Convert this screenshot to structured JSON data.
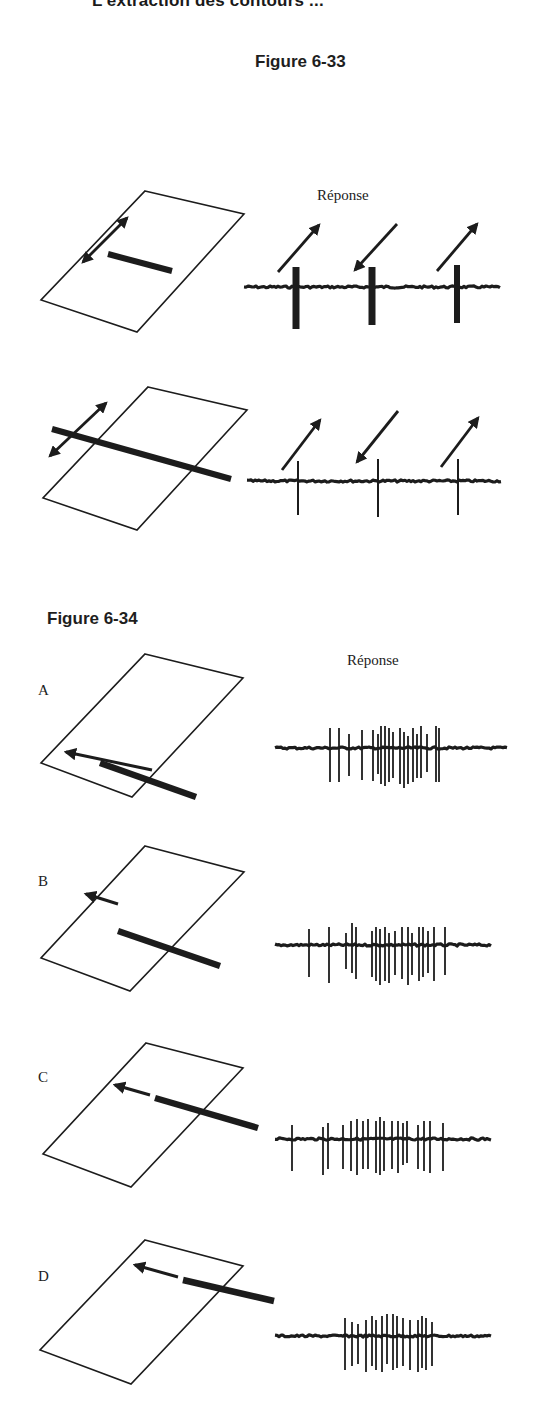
{
  "page": {
    "running_head": "L'extraction des contours ...",
    "figures": [
      {
        "id": "fig-6-33",
        "title": "Figure 6-33",
        "response_label": "Réponse",
        "rows": [
          {
            "stimulus": "short bar inside receptive field, moved back and forth (double arrow) parallel to long axis of field",
            "response_arrows": [
              "up-right",
              "down-left",
              "up-right"
            ],
            "response_strength": "strong bursts at each direction reversal"
          },
          {
            "stimulus": "long bar crossing receptive field, moved back and forth (double arrow)",
            "response_arrows": [
              "up-right",
              "down-left",
              "up-right"
            ],
            "response_strength": "single thin spikes at each reversal"
          }
        ]
      },
      {
        "id": "fig-6-34",
        "title": "Figure 6-34",
        "response_label": "Réponse",
        "panels": [
          {
            "letter": "A",
            "stimulus": "bar fully inside field, moving left",
            "response": "dense burst"
          },
          {
            "letter": "B",
            "stimulus": "bar extending slightly beyond field, moving left",
            "response": "dense burst"
          },
          {
            "letter": "C",
            "stimulus": "bar extending further beyond field, moving left",
            "response": "dense burst"
          },
          {
            "letter": "D",
            "stimulus": "bar mostly beyond field edge, moving left",
            "response": "narrower burst"
          }
        ]
      }
    ]
  },
  "colors": {
    "ink": "#1c1c1c",
    "background": "#ffffff"
  },
  "traces": {
    "fig33_row1": {
      "x0": 244,
      "x1": 500,
      "y": 287,
      "spikes": [
        {
          "x": 296,
          "up": 20,
          "down": 42,
          "w": 7
        },
        {
          "x": 372,
          "up": 20,
          "down": 38,
          "w": 7
        },
        {
          "x": 457,
          "up": 22,
          "down": 36,
          "w": 6
        }
      ]
    },
    "fig33_row2": {
      "x0": 247,
      "x1": 502,
      "y": 481,
      "spikes": [
        {
          "x": 298,
          "up": 20,
          "down": 34,
          "w": 2
        },
        {
          "x": 378,
          "up": 22,
          "down": 36,
          "w": 2
        },
        {
          "x": 458,
          "up": 22,
          "down": 34,
          "w": 2
        }
      ]
    },
    "fig34_A": {
      "x0": 275,
      "x1": 507,
      "y": 748,
      "spikes": [
        {
          "x": 330,
          "up": 20,
          "down": 34
        },
        {
          "x": 339,
          "up": 20,
          "down": 34
        },
        {
          "x": 349,
          "up": 14,
          "down": 28
        },
        {
          "x": 362,
          "up": 18,
          "down": 32
        },
        {
          "x": 373,
          "up": 18,
          "down": 33
        },
        {
          "x": 378,
          "up": 14,
          "down": 26
        },
        {
          "x": 381,
          "up": 22,
          "down": 36
        },
        {
          "x": 385,
          "up": 22,
          "down": 38
        },
        {
          "x": 389,
          "up": 20,
          "down": 34
        },
        {
          "x": 393,
          "up": 16,
          "down": 30
        },
        {
          "x": 400,
          "up": 20,
          "down": 36
        },
        {
          "x": 404,
          "up": 16,
          "down": 40
        },
        {
          "x": 408,
          "up": 12,
          "down": 36
        },
        {
          "x": 413,
          "up": 20,
          "down": 34
        },
        {
          "x": 417,
          "up": 14,
          "down": 30
        },
        {
          "x": 421,
          "up": 22,
          "down": 30
        },
        {
          "x": 427,
          "up": 14,
          "down": 24
        },
        {
          "x": 436,
          "up": 22,
          "down": 34
        },
        {
          "x": 439,
          "up": 20,
          "down": 34
        }
      ]
    },
    "fig34_B": {
      "x0": 275,
      "x1": 491,
      "y": 945,
      "spikes": [
        {
          "x": 309,
          "up": 16,
          "down": 32
        },
        {
          "x": 329,
          "up": 18,
          "down": 38
        },
        {
          "x": 346,
          "up": 12,
          "down": 24
        },
        {
          "x": 352,
          "up": 22,
          "down": 28
        },
        {
          "x": 356,
          "up": 18,
          "down": 34
        },
        {
          "x": 372,
          "up": 14,
          "down": 32
        },
        {
          "x": 376,
          "up": 18,
          "down": 36
        },
        {
          "x": 380,
          "up": 16,
          "down": 40
        },
        {
          "x": 385,
          "up": 18,
          "down": 36
        },
        {
          "x": 389,
          "up": 12,
          "down": 38
        },
        {
          "x": 395,
          "up": 14,
          "down": 30
        },
        {
          "x": 402,
          "up": 18,
          "down": 34
        },
        {
          "x": 408,
          "up": 18,
          "down": 40
        },
        {
          "x": 412,
          "up": 12,
          "down": 30
        },
        {
          "x": 419,
          "up": 18,
          "down": 36
        },
        {
          "x": 423,
          "up": 18,
          "down": 32
        },
        {
          "x": 428,
          "up": 14,
          "down": 28
        },
        {
          "x": 434,
          "up": 18,
          "down": 36
        },
        {
          "x": 445,
          "up": 18,
          "down": 30
        }
      ]
    },
    "fig34_C": {
      "x0": 275,
      "x1": 491,
      "y": 1139,
      "spikes": [
        {
          "x": 292,
          "up": 14,
          "down": 32
        },
        {
          "x": 323,
          "up": 12,
          "down": 36
        },
        {
          "x": 328,
          "up": 16,
          "down": 30
        },
        {
          "x": 343,
          "up": 14,
          "down": 30
        },
        {
          "x": 351,
          "up": 18,
          "down": 32
        },
        {
          "x": 357,
          "up": 20,
          "down": 36
        },
        {
          "x": 363,
          "up": 18,
          "down": 30
        },
        {
          "x": 368,
          "up": 20,
          "down": 30
        },
        {
          "x": 376,
          "up": 18,
          "down": 34
        },
        {
          "x": 380,
          "up": 22,
          "down": 36
        },
        {
          "x": 384,
          "up": 18,
          "down": 32
        },
        {
          "x": 392,
          "up": 18,
          "down": 30
        },
        {
          "x": 398,
          "up": 18,
          "down": 34
        },
        {
          "x": 403,
          "up": 16,
          "down": 26
        },
        {
          "x": 407,
          "up": 18,
          "down": 24
        },
        {
          "x": 418,
          "up": 14,
          "down": 30
        },
        {
          "x": 424,
          "up": 18,
          "down": 32
        },
        {
          "x": 430,
          "up": 18,
          "down": 34
        },
        {
          "x": 443,
          "up": 16,
          "down": 32
        }
      ]
    },
    "fig34_D": {
      "x0": 275,
      "x1": 491,
      "y": 1336,
      "spikes": [
        {
          "x": 345,
          "up": 18,
          "down": 34
        },
        {
          "x": 352,
          "up": 14,
          "down": 30
        },
        {
          "x": 358,
          "up": 12,
          "down": 28
        },
        {
          "x": 366,
          "up": 16,
          "down": 36
        },
        {
          "x": 372,
          "up": 20,
          "down": 30
        },
        {
          "x": 376,
          "up": 16,
          "down": 34
        },
        {
          "x": 382,
          "up": 20,
          "down": 36
        },
        {
          "x": 387,
          "up": 22,
          "down": 28
        },
        {
          "x": 393,
          "up": 22,
          "down": 34
        },
        {
          "x": 397,
          "up": 20,
          "down": 32
        },
        {
          "x": 403,
          "up": 18,
          "down": 30
        },
        {
          "x": 410,
          "up": 16,
          "down": 34
        },
        {
          "x": 418,
          "up": 16,
          "down": 36
        },
        {
          "x": 422,
          "up": 20,
          "down": 32
        },
        {
          "x": 426,
          "up": 18,
          "down": 34
        },
        {
          "x": 432,
          "up": 14,
          "down": 30
        }
      ]
    }
  }
}
